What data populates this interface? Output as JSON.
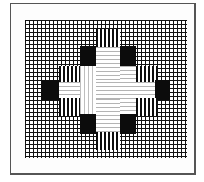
{
  "diagram": {
    "type": "grid-pattern",
    "grid": {
      "columns": 40,
      "rows": 34,
      "line_color": "#111111",
      "background": "#ffffff"
    },
    "colors": {
      "solid": "#0c0c0c",
      "hatched": "#0c0c0c",
      "empty": "#ffffff",
      "frame": "#555555"
    },
    "regions": [
      {
        "name": "top-hatch",
        "fill": "hatched"
      },
      {
        "name": "upper-left-black",
        "fill": "solid"
      },
      {
        "name": "upper-right-black",
        "fill": "solid"
      },
      {
        "name": "mid-left-hatch-upper",
        "fill": "hatched"
      },
      {
        "name": "mid-right-hatch-upper",
        "fill": "hatched"
      },
      {
        "name": "far-left-black",
        "fill": "solid"
      },
      {
        "name": "far-right-black",
        "fill": "solid"
      },
      {
        "name": "mid-left-hatch-lower",
        "fill": "hatched"
      },
      {
        "name": "mid-right-hatch-lower",
        "fill": "hatched"
      },
      {
        "name": "lower-left-black",
        "fill": "solid"
      },
      {
        "name": "lower-right-black",
        "fill": "solid"
      },
      {
        "name": "bottom-hatch",
        "fill": "hatched"
      },
      {
        "name": "center-cross",
        "fill": "empty"
      }
    ]
  }
}
